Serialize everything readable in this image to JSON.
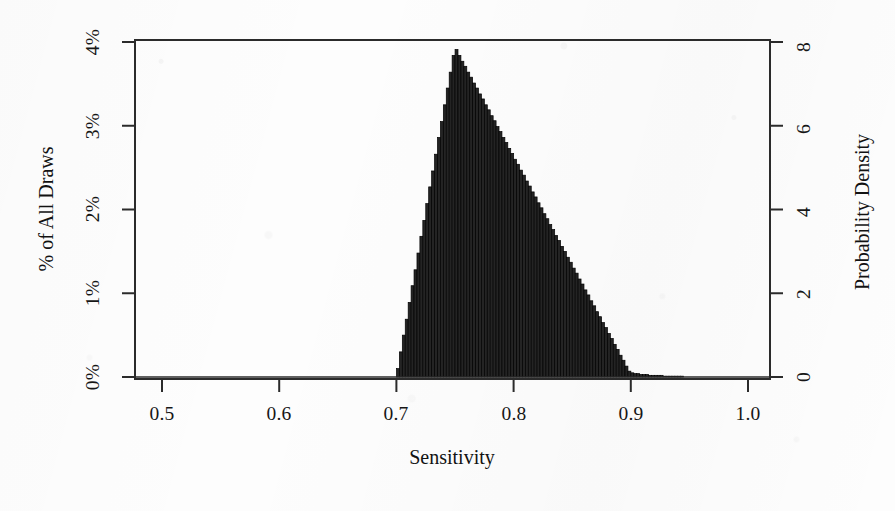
{
  "chart_data": {
    "type": "bar",
    "subtype": "histogram",
    "title": "",
    "subtitle": "",
    "xlabel": "Sensitivity",
    "ylabel": "% of All Draws",
    "y2label": "Probability Density",
    "xlim": [
      0.5,
      1.0
    ],
    "ylim": [
      0,
      4
    ],
    "y2lim": [
      0,
      8
    ],
    "grid": false,
    "legend": null,
    "xticks": [
      0.5,
      0.6,
      0.7,
      0.8,
      0.9,
      1.0
    ],
    "xticklabels": [
      "0.5",
      "0.6",
      "0.7",
      "0.8",
      "0.9",
      "1.0"
    ],
    "yticks": [
      0,
      1,
      2,
      3,
      4
    ],
    "yticklabels": [
      "0%",
      "1%",
      "2%",
      "3%",
      "4%"
    ],
    "y2ticks": [
      0,
      2,
      4,
      6,
      8
    ],
    "y2ticklabels": [
      "0",
      "2",
      "4",
      "6",
      "8"
    ],
    "bar_color": "#242424",
    "bar_edge_color": "#000000",
    "distribution_shape": "triangular",
    "distribution_min": 0.7,
    "distribution_mode": 0.8,
    "distribution_max": 0.95,
    "peak_percent_of_draws": 3.93,
    "peak_probability_density": 7.98,
    "bin_width": 0.0025,
    "x": [
      0.7013,
      0.7038,
      0.7063,
      0.7088,
      0.7113,
      0.7138,
      0.7163,
      0.7188,
      0.7213,
      0.7238,
      0.7263,
      0.7288,
      0.7313,
      0.7338,
      0.7363,
      0.7388,
      0.7413,
      0.7438,
      0.7463,
      0.7488,
      0.7513,
      0.7538,
      0.7563,
      0.7588,
      0.7613,
      0.7638,
      0.7663,
      0.7688,
      0.7713,
      0.7738,
      0.7763,
      0.7788,
      0.7813,
      0.7838,
      0.7863,
      0.7888,
      0.7913,
      0.7938,
      0.7963,
      0.7988,
      0.8013,
      0.8038,
      0.8063,
      0.8088,
      0.8113,
      0.8138,
      0.8163,
      0.8188,
      0.8213,
      0.8238,
      0.8263,
      0.8288,
      0.8313,
      0.8338,
      0.8363,
      0.8388,
      0.8413,
      0.8438,
      0.8463,
      0.8488,
      0.8513,
      0.8538,
      0.8563,
      0.8588,
      0.8613,
      0.8638,
      0.8663,
      0.8688,
      0.8713,
      0.8738,
      0.8763,
      0.8788,
      0.8813,
      0.8838,
      0.8863,
      0.8888,
      0.8913,
      0.8938,
      0.8963,
      0.8988,
      0.9013,
      0.9038,
      0.9063,
      0.9088,
      0.9113,
      0.9138,
      0.9163,
      0.9188,
      0.9213,
      0.9238,
      0.9263,
      0.9288,
      0.9313,
      0.9338,
      0.9363,
      0.9388,
      0.9413,
      0.9438,
      0.9463,
      0.9488
    ],
    "values_percent": [
      0.1,
      0.3,
      0.5,
      0.69,
      0.89,
      1.09,
      1.28,
      1.48,
      1.68,
      1.87,
      2.07,
      2.27,
      2.46,
      2.66,
      2.86,
      3.05,
      3.25,
      3.45,
      3.64,
      3.84,
      3.91,
      3.84,
      3.77,
      3.71,
      3.64,
      3.58,
      3.51,
      3.45,
      3.38,
      3.32,
      3.25,
      3.19,
      3.12,
      3.06,
      2.99,
      2.93,
      2.86,
      2.8,
      2.73,
      2.67,
      2.6,
      2.54,
      2.47,
      2.41,
      2.34,
      2.28,
      2.21,
      2.15,
      2.08,
      2.02,
      1.95,
      1.89,
      1.82,
      1.76,
      1.69,
      1.63,
      1.56,
      1.5,
      1.43,
      1.37,
      1.3,
      1.24,
      1.17,
      1.11,
      1.04,
      0.98,
      0.91,
      0.85,
      0.78,
      0.72,
      0.65,
      0.59,
      0.52,
      0.46,
      0.39,
      0.33,
      0.26,
      0.2,
      0.13,
      0.07,
      0.05,
      0.04,
      0.04,
      0.03,
      0.03,
      0.03,
      0.02,
      0.02,
      0.02,
      0.02,
      0.02,
      0.01,
      0.01,
      0.01,
      0.01,
      0.01,
      0.01,
      0.01,
      0.0,
      0.0
    ]
  },
  "axes": {
    "x_title": "Sensitivity",
    "y_left_title": "% of All Draws",
    "y_right_title": "Probability Density",
    "x_tick_labels": [
      "0.5",
      "0.6",
      "0.7",
      "0.8",
      "0.9",
      "1.0"
    ],
    "y_left_tick_labels": [
      "0%",
      "1%",
      "2%",
      "3%",
      "4%"
    ],
    "y_right_tick_labels": [
      "0",
      "2",
      "4",
      "6",
      "8"
    ]
  }
}
